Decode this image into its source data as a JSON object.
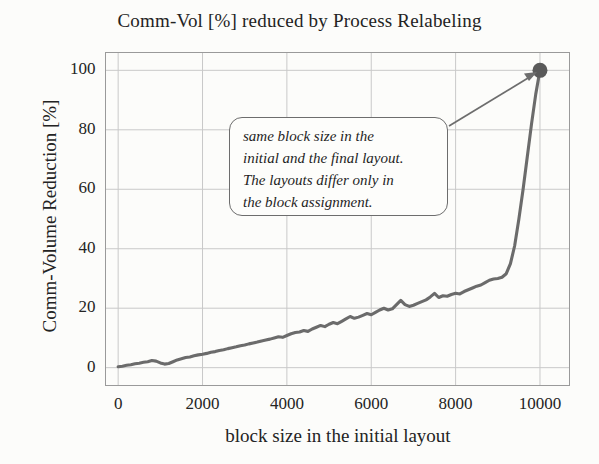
{
  "chart_data": {
    "type": "line",
    "title": "Comm-Vol [%] reduced by Process Relabeling",
    "xlabel": "block size in the initial layout",
    "ylabel": "Comm-Volume Reduction [%]",
    "xlim": [
      -300,
      10700
    ],
    "ylim": [
      -6,
      106
    ],
    "grid": true,
    "legend": false,
    "xticks": [
      "0",
      "2000",
      "4000",
      "6000",
      "8000",
      "10000"
    ],
    "xtick_values": [
      0,
      2000,
      4000,
      6000,
      8000,
      10000
    ],
    "yticks": [
      "0",
      "20",
      "40",
      "60",
      "80",
      "100"
    ],
    "ytick_values": [
      0,
      20,
      40,
      60,
      80,
      100
    ],
    "series": [
      {
        "name": "Comm-Volume Reduction",
        "color": "#6b6b6b",
        "x": [
          0,
          100,
          200,
          300,
          400,
          500,
          600,
          700,
          800,
          900,
          1000,
          1100,
          1200,
          1300,
          1400,
          1500,
          1600,
          1700,
          1800,
          1900,
          2000,
          2100,
          2200,
          2300,
          2400,
          2500,
          2600,
          2700,
          2800,
          2900,
          3000,
          3100,
          3200,
          3300,
          3400,
          3500,
          3600,
          3700,
          3800,
          3900,
          4000,
          4100,
          4200,
          4300,
          4400,
          4500,
          4600,
          4700,
          4800,
          4900,
          5000,
          5100,
          5200,
          5300,
          5400,
          5500,
          5600,
          5700,
          5800,
          5900,
          6000,
          6100,
          6200,
          6300,
          6400,
          6500,
          6600,
          6700,
          6800,
          6900,
          7000,
          7100,
          7200,
          7300,
          7400,
          7500,
          7600,
          7700,
          7800,
          7900,
          8000,
          8100,
          8200,
          8300,
          8400,
          8500,
          8600,
          8700,
          8800,
          8900,
          9000,
          9100,
          9200,
          9300,
          9400,
          9500,
          9600,
          9700,
          9800,
          9900,
          10000
        ],
        "y": [
          0.3,
          0.5,
          0.8,
          1.0,
          1.3,
          1.5,
          1.8,
          2.0,
          2.4,
          2.2,
          1.6,
          1.2,
          1.4,
          2.0,
          2.6,
          3.0,
          3.4,
          3.6,
          4.0,
          4.3,
          4.5,
          4.8,
          5.2,
          5.4,
          5.8,
          6.0,
          6.4,
          6.7,
          7.0,
          7.4,
          7.6,
          8.0,
          8.3,
          8.6,
          9.0,
          9.3,
          9.6,
          10.0,
          10.4,
          10.2,
          10.8,
          11.4,
          11.8,
          12.0,
          12.5,
          12.2,
          13.0,
          13.6,
          14.2,
          13.8,
          14.6,
          15.2,
          14.8,
          15.6,
          16.4,
          17.2,
          16.6,
          17.0,
          17.6,
          18.2,
          17.8,
          18.6,
          19.4,
          20.0,
          19.4,
          19.8,
          21.2,
          22.6,
          21.2,
          20.6,
          21.0,
          21.6,
          22.2,
          22.8,
          23.8,
          25.0,
          23.6,
          24.2,
          24.0,
          24.6,
          25.0,
          24.8,
          25.6,
          26.2,
          26.8,
          27.4,
          27.8,
          28.6,
          29.4,
          29.8,
          30.0,
          30.4,
          31.6,
          35.0,
          41.0,
          50.0,
          60.0,
          71.0,
          82.0,
          92.0,
          100.0
        ]
      }
    ],
    "endpoint_marker": {
      "x": 10000,
      "y": 100,
      "color": "#5a5a5a",
      "shape": "circle"
    },
    "annotations": [
      {
        "type": "callout",
        "lines": [
          "same block size in the",
          "initial and the final layout.",
          "The layouts differ only in",
          "the block assignment."
        ],
        "arrow_to": {
          "x": 10000,
          "y": 100
        }
      }
    ]
  },
  "colors": {
    "line": "#6b6b6b",
    "grid": "#c9c9c9",
    "frame": "#9a9a9a",
    "text": "#232323",
    "background": "#fcfcfa"
  }
}
